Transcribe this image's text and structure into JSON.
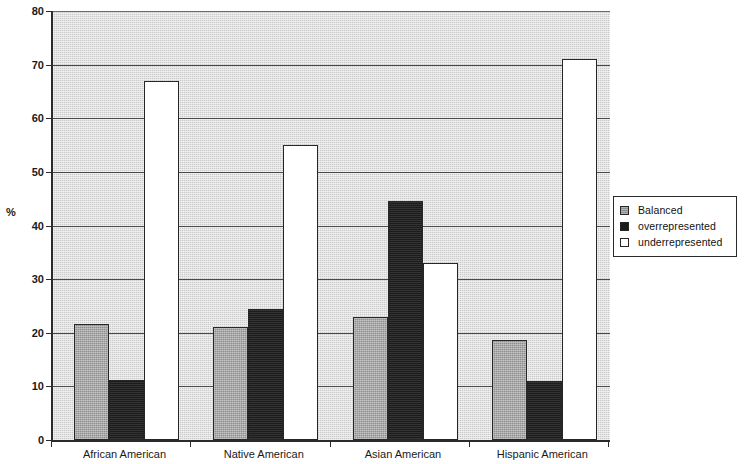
{
  "chart_data": {
    "type": "bar",
    "title": "",
    "xlabel": "",
    "ylabel": "%",
    "ylim": [
      0,
      80
    ],
    "yticks": [
      0,
      10,
      20,
      30,
      40,
      50,
      60,
      70,
      80
    ],
    "grid": true,
    "legend_position": "right",
    "categories": [
      "African American",
      "Native American",
      "Asian American",
      "Hispanic American"
    ],
    "series": [
      {
        "name": "Balanced",
        "color": "#8f8f8f",
        "values": [
          21.7,
          21.0,
          23.0,
          18.7
        ]
      },
      {
        "name": "overrepresented",
        "color": "#1c1c1c",
        "values": [
          11.2,
          24.5,
          44.6,
          11.0
        ]
      },
      {
        "name": "underrepresented",
        "color": "#ffffff",
        "values": [
          67.0,
          55.0,
          33.0,
          71.0
        ]
      }
    ]
  },
  "axes": {
    "y_title": "%",
    "y_tick_labels": [
      "0",
      "10",
      "20",
      "30",
      "40",
      "50",
      "60",
      "70",
      "80"
    ],
    "x_tick_labels": [
      "African American",
      "Native American",
      "Asian American",
      "Hispanic American"
    ]
  },
  "legend": {
    "items": [
      {
        "label": "Balanced",
        "swatch": "balanced-swatch"
      },
      {
        "label": "overrepresented",
        "swatch": "overrepresented-swatch"
      },
      {
        "label": "underrepresented",
        "swatch": "underrepresented-swatch"
      }
    ]
  },
  "colors": {
    "plot_background": "#cbcbcb",
    "axis": "#2b2b2b",
    "gridline": "#4a4a4a",
    "balanced": "#8f8f8f",
    "overrepresented": "#1c1c1c",
    "underrepresented": "#ffffff"
  }
}
